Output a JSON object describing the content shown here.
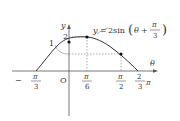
{
  "diagram": {
    "type": "function-graph",
    "equation": {
      "lhs": "y",
      "eq": "=",
      "coef": "2sin",
      "arg_var": "θ",
      "plus": "+",
      "frac_num": "π",
      "frac_den": "3"
    },
    "axes": {
      "x_label": "θ",
      "y_label": "y",
      "origin_label": "O"
    },
    "y_ticks": [
      {
        "label": "2",
        "value": 2
      },
      {
        "label": "1",
        "value": 1
      }
    ],
    "x_ticks": [
      {
        "sign": "−",
        "num": "π",
        "den": "3",
        "value": "-π/3"
      },
      {
        "sign": "",
        "num": "π",
        "den": "6",
        "value": "π/6"
      },
      {
        "sign": "",
        "num": "π",
        "den": "2",
        "value": "π/2"
      },
      {
        "sign": "",
        "num": "2",
        "den": "3",
        "suffix": "π",
        "value": "2π/3"
      }
    ],
    "marked_points": [
      {
        "x": "0",
        "y": "√3"
      },
      {
        "x": "π/6",
        "y": "2"
      },
      {
        "x": "π/2",
        "y": "1"
      }
    ],
    "colors": {
      "curve": "#333333",
      "axis": "#555555",
      "dashed": "#777777",
      "point": "#111111"
    }
  }
}
